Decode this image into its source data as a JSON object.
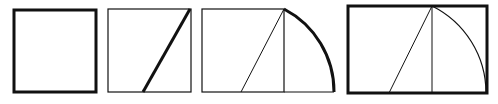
{
  "colors": {
    "background": "#ffffff",
    "stroke": "#111111"
  },
  "figures": [
    {
      "step": 1,
      "description": "Square (heavy outline)",
      "square": {
        "x1": 14,
        "y1": 10,
        "x2": 96,
        "y2": 92,
        "stroke_width": 3
      }
    },
    {
      "step": 2,
      "description": "Square with heavy diagonal from bottom midpoint to top-right corner",
      "square": {
        "x1": 108,
        "y1": 9,
        "x2": 191,
        "y2": 92,
        "stroke_width": 1.2
      },
      "diagonal": {
        "x1": 143,
        "y1": 92,
        "x2": 190,
        "y2": 9,
        "stroke_width": 3
      }
    },
    {
      "step": 3,
      "description": "Diagonal swung down as heavy arc to extended baseline",
      "square": {
        "x1": 202,
        "y1": 9,
        "x2": 284,
        "y2": 92,
        "stroke_width": 1.2
      },
      "diagonal": {
        "x1": 241,
        "y1": 92,
        "x2": 284,
        "y2": 9,
        "stroke_width": 1
      },
      "extension": {
        "x1": 284,
        "y2": 92,
        "x2": 334,
        "stroke_width": 1.2
      },
      "arc": {
        "from_x": 284,
        "from_y": 9,
        "to_x": 334,
        "to_y": 92,
        "radius": 93,
        "stroke_width": 3
      }
    },
    {
      "step": 4,
      "description": "Completed golden rectangle (heavy outline)",
      "rect": {
        "x1": 348,
        "y1": 6,
        "x2": 487,
        "y2": 93,
        "stroke_width": 3
      },
      "divider": {
        "x": 432,
        "stroke_width": 1
      },
      "diagonal": {
        "x1": 389,
        "y1": 93,
        "x2": 432,
        "y2": 6,
        "stroke_width": 1
      },
      "arc": {
        "from_x": 432,
        "from_y": 6,
        "to_x": 486,
        "to_y": 93,
        "radius": 97,
        "stroke_width": 1.2
      }
    }
  ]
}
